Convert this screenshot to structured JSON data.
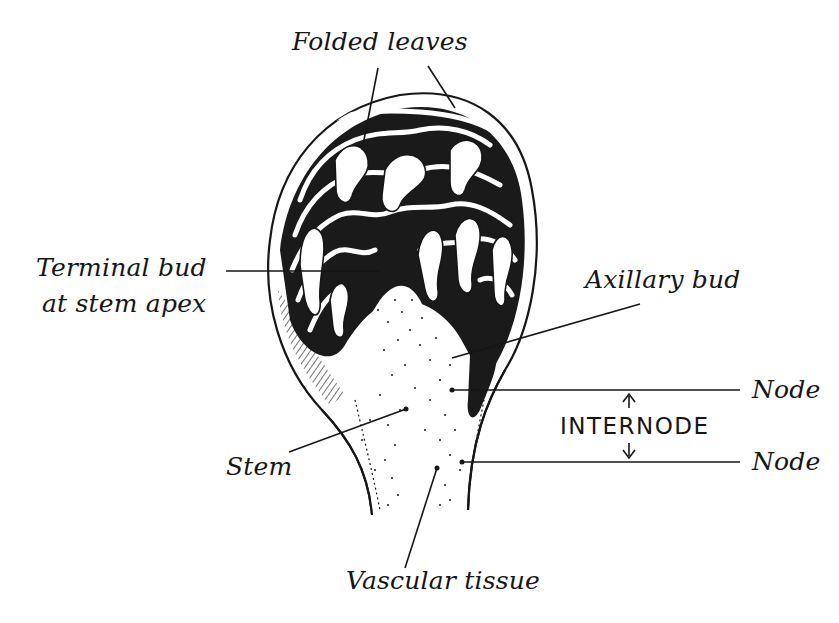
{
  "diagram": {
    "type": "labeled-illustration",
    "colors": {
      "ink": "#161616",
      "paper": "#ffffff"
    },
    "labels": {
      "folded_leaves": "Folded leaves",
      "terminal_bud_line1": "Terminal bud",
      "terminal_bud_line2": "at stem apex",
      "axillary_bud": "Axillary bud",
      "node_upper": "Node",
      "internode": "INTERNODE",
      "node_lower": "Node",
      "stem": "Stem",
      "vascular_tissue": "Vascular tissue"
    }
  }
}
